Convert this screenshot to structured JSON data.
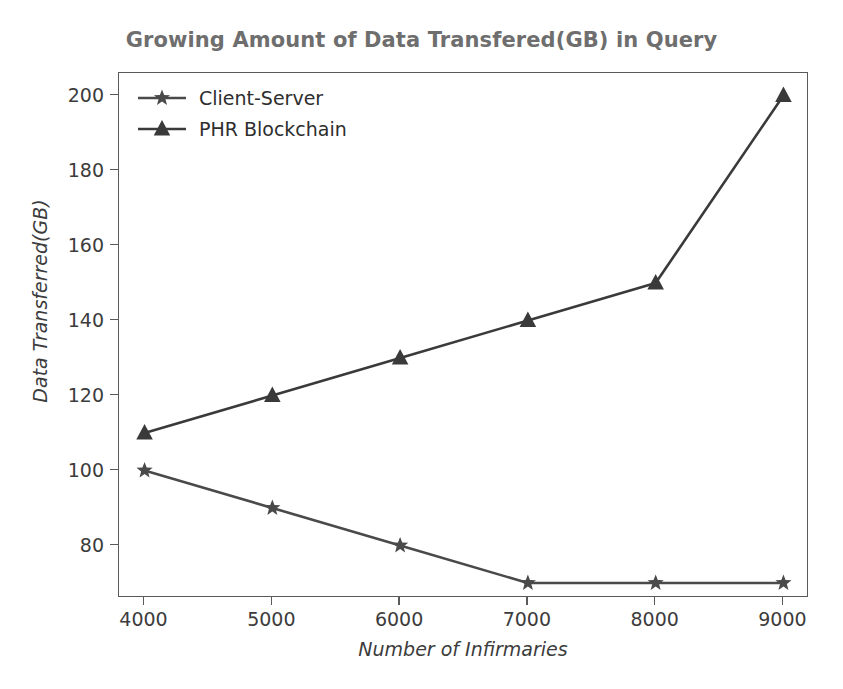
{
  "chart_data": {
    "type": "line",
    "title": "Growing Amount of Data Transfered(GB) in Query",
    "xlabel": "Number of Infirmaries",
    "ylabel": "Data Transferred(GB)",
    "x": [
      4000,
      5000,
      6000,
      7000,
      8000,
      9000
    ],
    "xtick_labels": [
      "4000",
      "5000",
      "6000",
      "7000",
      "8000",
      "9000"
    ],
    "ytick_labels": [
      "80",
      "100",
      "120",
      "140",
      "160",
      "180",
      "200"
    ],
    "yticks": [
      80,
      100,
      120,
      140,
      160,
      180,
      200
    ],
    "xlim": [
      3800,
      9200
    ],
    "ylim": [
      66,
      206
    ],
    "grid": false,
    "legend_position": "upper left",
    "series": [
      {
        "name": "Client-Server",
        "marker": "star",
        "color": "#4a4a4a",
        "values": [
          100,
          90,
          80,
          70,
          70,
          70
        ]
      },
      {
        "name": "PHR Blockchain",
        "marker": "triangle",
        "color": "#3a3a3a",
        "values": [
          110,
          120,
          130,
          140,
          150,
          200
        ]
      }
    ]
  },
  "style": {
    "title_color": "#6e6e6e",
    "axis_color": "#5a5a5a",
    "tick_text_color": "#3c3c3c",
    "background": "#ffffff"
  }
}
